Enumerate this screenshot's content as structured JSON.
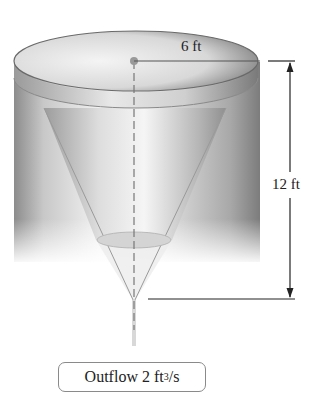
{
  "diagram": {
    "radius_label": "6 ft",
    "height_label": "12 ft",
    "outflow": {
      "prefix": "Outflow 2 ft",
      "exponent": "3",
      "suffix": "/s"
    },
    "colors": {
      "line": "#333333",
      "cylinder_dark": "#7a7a7a",
      "cylinder_light": "#e8e8e8",
      "box_border": "#8a8a8a"
    }
  }
}
